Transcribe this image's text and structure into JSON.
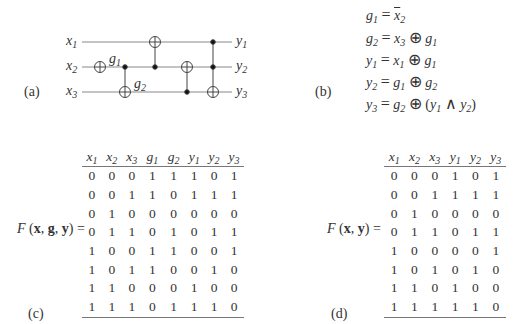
{
  "panels": {
    "a": {
      "label": "(a)",
      "circuit": {
        "inputs": [
          "x1",
          "x2",
          "x3"
        ],
        "outputs": [
          "y1",
          "y2",
          "y3"
        ],
        "intermediate_labels": [
          "g1",
          "g2"
        ],
        "gates": [
          {
            "type": "NOT",
            "target": "x2",
            "produces": "g1"
          },
          {
            "type": "CNOT",
            "control": "x2",
            "target": "x3",
            "produces": "g2"
          },
          {
            "type": "CNOT",
            "control": "x2",
            "target": "x1"
          },
          {
            "type": "CNOT",
            "control": "x3",
            "target": "x2"
          },
          {
            "type": "Toffoli",
            "controls": [
              "x1",
              "x2"
            ],
            "target": "x3"
          }
        ]
      }
    },
    "b": {
      "label": "(b)",
      "equations": [
        {
          "lhs": "g",
          "lhs_sub": "1",
          "rhs": "= x̄₂"
        },
        {
          "lhs": "g",
          "lhs_sub": "2",
          "rhs": "= x₃ ⊕ g₁"
        },
        {
          "lhs": "y",
          "lhs_sub": "1",
          "rhs": "= x₁ ⊕ g₁"
        },
        {
          "lhs": "y",
          "lhs_sub": "2",
          "rhs": "= g₁ ⊕ g₂"
        },
        {
          "lhs": "y",
          "lhs_sub": "3",
          "rhs": "= g₂ ⊕ (y₁ ∧ y₂)"
        }
      ]
    },
    "c": {
      "label": "(c)",
      "function_label": "F (x, g, y) =",
      "headers": [
        [
          "x",
          "1"
        ],
        [
          "x",
          "2"
        ],
        [
          "x",
          "3"
        ],
        [
          "g",
          "1"
        ],
        [
          "g",
          "2"
        ],
        [
          "y",
          "1"
        ],
        [
          "y",
          "2"
        ],
        [
          "y",
          "3"
        ]
      ],
      "rows": [
        [
          0,
          0,
          0,
          1,
          1,
          1,
          0,
          1
        ],
        [
          0,
          0,
          1,
          1,
          0,
          1,
          1,
          1
        ],
        [
          0,
          1,
          0,
          0,
          0,
          0,
          0,
          0
        ],
        [
          0,
          1,
          1,
          0,
          1,
          0,
          1,
          1
        ],
        [
          1,
          0,
          0,
          1,
          1,
          0,
          0,
          1
        ],
        [
          1,
          0,
          1,
          1,
          0,
          0,
          1,
          0
        ],
        [
          1,
          1,
          0,
          0,
          0,
          1,
          0,
          0
        ],
        [
          1,
          1,
          1,
          0,
          1,
          1,
          1,
          0
        ]
      ]
    },
    "d": {
      "label": "(d)",
      "function_label": "F (x, y) =",
      "headers": [
        [
          "x",
          "1"
        ],
        [
          "x",
          "2"
        ],
        [
          "x",
          "3"
        ],
        [
          "y",
          "1"
        ],
        [
          "y",
          "2"
        ],
        [
          "y",
          "3"
        ]
      ],
      "rows": [
        [
          0,
          0,
          0,
          1,
          0,
          1
        ],
        [
          0,
          0,
          1,
          1,
          1,
          1
        ],
        [
          0,
          1,
          0,
          0,
          0,
          0
        ],
        [
          0,
          1,
          1,
          0,
          1,
          1
        ],
        [
          1,
          0,
          0,
          0,
          0,
          1
        ],
        [
          1,
          0,
          1,
          0,
          1,
          0
        ],
        [
          1,
          1,
          0,
          1,
          0,
          0
        ],
        [
          1,
          1,
          1,
          1,
          1,
          0
        ]
      ]
    }
  },
  "colors": {
    "ink": "#333333",
    "rule": "#777777",
    "wire": "#888888"
  }
}
